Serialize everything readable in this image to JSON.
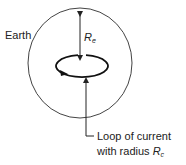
{
  "diagram": {
    "earth_label": "Earth",
    "radius_label": {
      "main": "R",
      "sub": "e"
    },
    "loop_label": {
      "line1": "Loop of current",
      "line2_prefix": "with radius ",
      "line2_var": "R",
      "line2_sub": "c"
    },
    "colors": {
      "stroke": "#222222",
      "earth_stroke": "#444444",
      "background": "#ffffff"
    }
  }
}
